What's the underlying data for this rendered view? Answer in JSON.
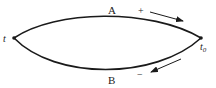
{
  "diagram": {
    "nodes": {
      "start": {
        "label": "t",
        "x": 14,
        "y": 38
      },
      "end": {
        "label": "t",
        "subscript": "0",
        "x": 201,
        "y": 38
      }
    },
    "paths": [
      {
        "name": "A",
        "label": "A",
        "sign": "+",
        "direction": "t to t0"
      },
      {
        "name": "B",
        "label": "B",
        "sign": "−",
        "direction": "t0 to t"
      }
    ],
    "colors": {
      "line": "#1a1a1a",
      "background": "#ffffff"
    }
  }
}
